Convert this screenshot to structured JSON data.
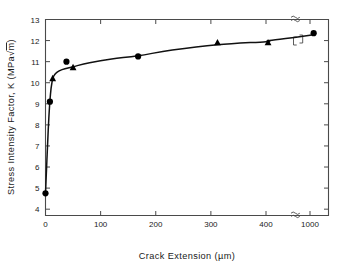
{
  "chart_data": {
    "type": "scatter",
    "title": "",
    "xlabel": "Crack Extension (µm)",
    "ylabel": "Stress Intensity Factor, K (MPa√m)",
    "xlim": [
      0,
      1100
    ],
    "ylim": [
      3.7,
      13
    ],
    "grid": false,
    "legend": "none",
    "axis_break": {
      "axis": "x",
      "note": "≈",
      "between": [
        450,
        950
      ],
      "description": "x-axis is broken between 400 and 1000"
    },
    "xticks": [
      {
        "value": 0,
        "label": "0"
      },
      {
        "value": 100,
        "label": "100"
      },
      {
        "value": 200,
        "label": "200"
      },
      {
        "value": 300,
        "label": "300"
      },
      {
        "value": 400,
        "label": "400"
      },
      {
        "value": 1000,
        "label": "1000"
      }
    ],
    "yticks": [
      {
        "value": 4,
        "label": "4"
      },
      {
        "value": 5,
        "label": "5"
      },
      {
        "value": 6,
        "label": "6"
      },
      {
        "value": 7,
        "label": "7"
      },
      {
        "value": 8,
        "label": "8"
      },
      {
        "value": 9,
        "label": "9"
      },
      {
        "value": 10,
        "label": "10"
      },
      {
        "value": 11,
        "label": "11"
      },
      {
        "value": 12,
        "label": "12"
      },
      {
        "value": 13,
        "label": "13"
      }
    ],
    "series": [
      {
        "name": "circles",
        "marker": "circle",
        "color": "#000000",
        "points": [
          {
            "x": 0,
            "y": 4.75
          },
          {
            "x": 8,
            "y": 9.1
          },
          {
            "x": 38,
            "y": 11.0
          },
          {
            "x": 168,
            "y": 11.25
          },
          {
            "x": 1050,
            "y": 12.35
          }
        ]
      },
      {
        "name": "triangles",
        "marker": "triangle",
        "color": "#000000",
        "points": [
          {
            "x": 13,
            "y": 10.2
          },
          {
            "x": 50,
            "y": 10.72
          },
          {
            "x": 312,
            "y": 11.9
          },
          {
            "x": 428,
            "y": 11.9
          }
        ]
      }
    ],
    "curve": {
      "description": "Smooth R-curve rising steeply from 4.75 at x=0 to ~10.3 by x=15, then gradually to ~12.4 at x=1050",
      "points": [
        {
          "x": 0,
          "y": 4.75
        },
        {
          "x": 3,
          "y": 6.6
        },
        {
          "x": 6,
          "y": 8.3
        },
        {
          "x": 9,
          "y": 9.45
        },
        {
          "x": 12,
          "y": 10.05
        },
        {
          "x": 15,
          "y": 10.32
        },
        {
          "x": 20,
          "y": 10.48
        },
        {
          "x": 30,
          "y": 10.62
        },
        {
          "x": 50,
          "y": 10.76
        },
        {
          "x": 80,
          "y": 10.95
        },
        {
          "x": 120,
          "y": 11.13
        },
        {
          "x": 168,
          "y": 11.28
        },
        {
          "x": 230,
          "y": 11.55
        },
        {
          "x": 312,
          "y": 11.8
        },
        {
          "x": 400,
          "y": 11.95
        },
        {
          "x": 450,
          "y": 12.0
        },
        {
          "x": 1000,
          "y": 12.25
        },
        {
          "x": 1050,
          "y": 12.35
        }
      ]
    }
  }
}
